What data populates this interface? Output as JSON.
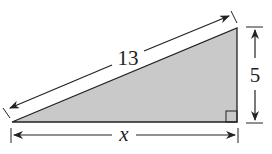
{
  "diagram": {
    "type": "right-triangle",
    "fill_color": "#c9c9c9",
    "stroke_color": "#222222",
    "labels": {
      "hypotenuse": "13",
      "height": "5",
      "base": "x"
    }
  }
}
